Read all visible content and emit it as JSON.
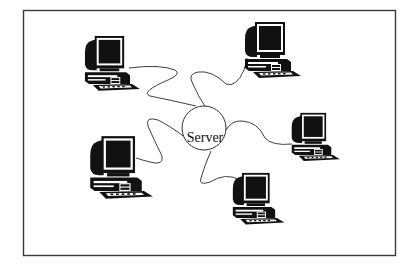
{
  "diagram": {
    "type": "star-network-topology",
    "center_node": {
      "label": "Server",
      "shape": "circle"
    },
    "client_nodes": [
      {
        "id": "computer-top-left",
        "icon": "desktop-computer-icon"
      },
      {
        "id": "computer-top-right",
        "icon": "desktop-computer-icon"
      },
      {
        "id": "computer-right",
        "icon": "desktop-computer-icon"
      },
      {
        "id": "computer-bottom-left",
        "icon": "desktop-computer-icon"
      },
      {
        "id": "computer-bottom",
        "icon": "desktop-computer-icon"
      }
    ],
    "connections": [
      {
        "from": "Server",
        "to": "computer-top-left",
        "style": "wavy-cable"
      },
      {
        "from": "Server",
        "to": "computer-top-right",
        "style": "wavy-cable"
      },
      {
        "from": "Server",
        "to": "computer-right",
        "style": "wavy-cable"
      },
      {
        "from": "Server",
        "to": "computer-bottom-left",
        "style": "wavy-cable"
      },
      {
        "from": "Server",
        "to": "computer-bottom",
        "style": "wavy-cable"
      }
    ],
    "colors": {
      "line": "#2a2a2a",
      "fill": "#111111",
      "background": "#ffffff"
    }
  }
}
